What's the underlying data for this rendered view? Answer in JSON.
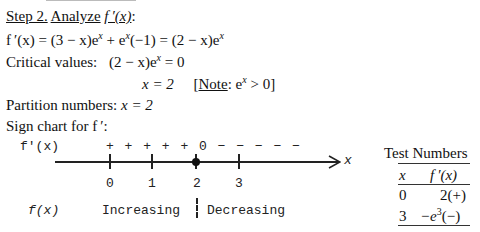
{
  "heading": {
    "step": "Step 2.",
    "action": "Analyze",
    "func": "f ′(x)",
    "colon": ":"
  },
  "derivative": {
    "lhs": "f ′(x) = (3 − x)e",
    "exp1": "x",
    "mid1": " + e",
    "exp2": "x",
    "mid2": "(−1) = (2 − x)e",
    "exp3": "x"
  },
  "critical": {
    "label": "Critical values:",
    "eq": "(2 − x)e",
    "exp": "x",
    "rhs": " = 0",
    "solution": "x = 2",
    "note_open": "[",
    "note_label": "Note",
    "note_text": ": e",
    "note_exp": "x",
    "note_rhs": " > 0]"
  },
  "partition": {
    "label": "Partition numbers:",
    "value": "x = 2"
  },
  "sign_chart": {
    "title": "Sign chart for f ′:",
    "fprime_label": "f'(x)",
    "signs": "+ + + + + 0 − − − − −",
    "axis_label": "x",
    "ticks": [
      "0",
      "1",
      "2",
      "3"
    ],
    "critical_point": "2",
    "f_label": "f(x)",
    "intervals": [
      "Increasing",
      "Decreasing"
    ]
  },
  "test_numbers": {
    "title": "Test Numbers",
    "headers": [
      "x",
      "f ′(x)"
    ],
    "rows": [
      {
        "x": "0",
        "value": "2(+)"
      },
      {
        "x": "3",
        "value_pre": "−e",
        "value_exp": "3",
        "value_post": "(−)"
      }
    ]
  }
}
